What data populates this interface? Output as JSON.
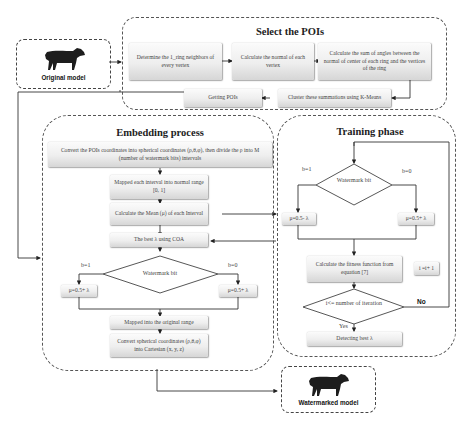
{
  "models": {
    "original": {
      "label": "Original model",
      "icon": "cow-icon"
    },
    "watermarked": {
      "label": "Watermarked model",
      "icon": "cow-icon"
    }
  },
  "select_pois": {
    "title": "Select the POIs",
    "steps": [
      "Determine the 1_ring neighbors of every vertex",
      "Calculate the normal of each vertex",
      "Calculate the sum of angles between the normal of center of each ring and the vertices of the ring",
      "Cluster these summations using K-Means",
      "Getting POIs"
    ]
  },
  "embedding": {
    "title": "Embedding process",
    "convert": "Convert the POIs coordinates into spherical coordinates (ρ,θ,φ), then divide the ρ into M (number of watermark  bits) intervals",
    "mapped_normal": "Mapped each interval into normal range [0, 1]",
    "calc_mean": "Calculate the Mean (μ) of each Interval",
    "best_lambda": "The best λ using COA",
    "decision": "Watermark bit",
    "branch_left_label": "b=1",
    "branch_right_label": "b=0",
    "left_formula": "μ=0.5+ λ",
    "right_formula": "μ=0.5+ λ",
    "mapped_original": "Mapped into the original range",
    "convert_back": "Convert spherical coordinates (ρ,θ,φ) into Cartesian (x, y, z)"
  },
  "training": {
    "title": "Training phase",
    "decision": "Watermark bit",
    "branch_left_label": "b=1",
    "branch_right_label": "b=0",
    "left_formula": "μ=0.5- λ",
    "right_formula": "μ=0.5+ λ",
    "fitness": "Calculate the fitness function from equation [7]",
    "increment": "i =i+ 1",
    "loop_decision": "i<= number of iteration",
    "yes_label": "Yes",
    "no_label": "No",
    "detect": "Detecting best λ"
  },
  "colors": {
    "line": "#333333",
    "dashed_border": "#555555",
    "box_top": "#fbfbfb",
    "box_bottom": "#d6d6d6"
  }
}
